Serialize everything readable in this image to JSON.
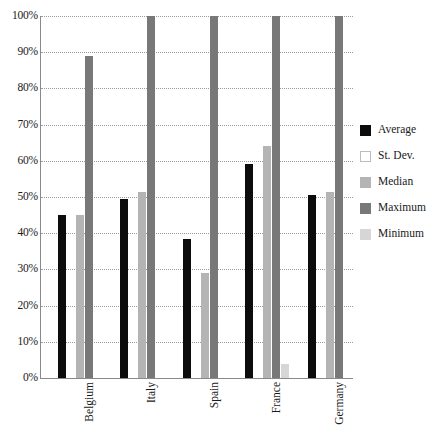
{
  "chart_data": {
    "type": "bar",
    "title": "",
    "xlabel": "",
    "ylabel": "",
    "ylim": [
      0,
      100
    ],
    "grid": true,
    "legend_position": "right",
    "categories": [
      "Belgium",
      "Italy",
      "Spain",
      "France",
      "Germany"
    ],
    "ytick_labels": [
      "100%",
      "90%",
      "80%",
      "70%",
      "60%",
      "50%",
      "40%",
      "30%",
      "20%",
      "10%",
      "0%"
    ],
    "ytick_values": [
      100,
      90,
      80,
      70,
      60,
      50,
      40,
      30,
      20,
      10,
      0
    ],
    "series": [
      {
        "name": "Average",
        "color": "#0c0c0c",
        "values": [
          45.0,
          49.5,
          38.5,
          59.0,
          50.5
        ]
      },
      {
        "name": "St. Dev.",
        "color": "#ffffff",
        "values": [
          0,
          0,
          0,
          0,
          0
        ]
      },
      {
        "name": "Median",
        "color": "#b4b4b4",
        "values": [
          45.0,
          51.5,
          29.0,
          64.0,
          51.5
        ]
      },
      {
        "name": "Maximum",
        "color": "#787878",
        "values": [
          89.0,
          100.0,
          100.0,
          100.0,
          100.0
        ]
      },
      {
        "name": "Minimum",
        "color": "#d6d6d6",
        "values": [
          0,
          0,
          0,
          4.0,
          0
        ]
      }
    ]
  },
  "legend": {
    "items": [
      {
        "label": "Average",
        "swatch": "sw-average"
      },
      {
        "label": "St. Dev.",
        "swatch": "sw-stdev"
      },
      {
        "label": "Median",
        "swatch": "sw-median"
      },
      {
        "label": "Maximum",
        "swatch": "sw-maximum"
      },
      {
        "label": "Minimum",
        "swatch": "sw-minimum"
      }
    ]
  }
}
